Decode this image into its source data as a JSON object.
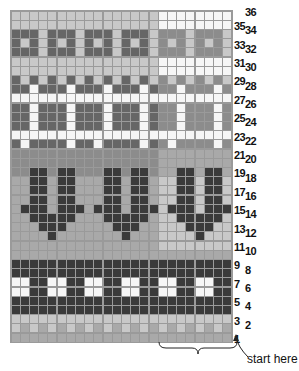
{
  "colors": {
    "W": "#f6f6f6",
    "L": "#c8c8c8",
    "M": "#a9a9a9",
    "G": "#8c8c8c",
    "D": "#666666",
    "K": "#3a3a3a"
  },
  "repeat_note": "8-stitch repeat highlighted in the right-hand columns",
  "columns": 24,
  "repeat_width": 8,
  "rows": [
    {
      "n": 36,
      "pattern": "LLLLLLLL",
      "right": "WWWWWWWW"
    },
    {
      "n": 35,
      "pattern": "LLLLLLLL",
      "right": "WWWWWWWW"
    },
    {
      "n": 34,
      "pattern": "DDDLDDDL",
      "right": "GGGLGGGL"
    },
    {
      "n": 33,
      "pattern": "DLDLDLDL",
      "right": "GLGLGLGL"
    },
    {
      "n": 32,
      "pattern": "DDDLDDDL",
      "right": "GGGLGGGL"
    },
    {
      "n": 31,
      "pattern": "LLLLLLLL",
      "right": "WWWWWWWW"
    },
    {
      "n": 30,
      "pattern": "LLLLLLLL",
      "right": "WWWWWWWW"
    },
    {
      "n": 29,
      "pattern": "DLDLDLDL",
      "right": "GLGLGLGL"
    },
    {
      "n": 28,
      "pattern": "DDWDDDWD",
      "right": "GGWGGGWG"
    },
    {
      "n": 27,
      "pattern": "WWWWWWWW",
      "right": "WWWWWWWW"
    },
    {
      "n": 26,
      "pattern": "DDWDDDWD",
      "right": "GGWGGGWG"
    },
    {
      "n": 25,
      "pattern": "DDWDDDWD",
      "right": "GGWGGGWG"
    },
    {
      "n": 24,
      "pattern": "DDWDDDWD",
      "right": "GGWGGGWG"
    },
    {
      "n": 23,
      "pattern": "WWWWWWWW",
      "right": "WWWWWWWW"
    },
    {
      "n": 22,
      "pattern": "DWDDDDWD",
      "right": "GWGGGGWG"
    },
    {
      "n": 21,
      "pattern": "GGGGGGGG",
      "right": "MMMMMMMM"
    },
    {
      "n": 20,
      "pattern": "GGGGGGGG",
      "right": "MMMMMMMM"
    },
    {
      "n": 19,
      "pattern": "GGKKGKKG",
      "right": "MMKKMKKM"
    },
    {
      "n": 18,
      "pattern": "MMKKMKKM",
      "right": "LLKKLKKL"
    },
    {
      "n": 17,
      "pattern": "MMKKMKKM",
      "right": "LLKKLKKL"
    },
    {
      "n": 16,
      "pattern": "MMKKMKKM",
      "right": "LLKKLKKL"
    },
    {
      "n": 15,
      "pattern": "MKKKMKKK",
      "right": "LKKKLKKK"
    },
    {
      "n": 14,
      "pattern": "MMKKKKKM",
      "right": "LLKKKKKL"
    },
    {
      "n": 13,
      "pattern": "MMMKKKMM",
      "right": "LLLKKKLL"
    },
    {
      "n": 12,
      "pattern": "MMMMKMMM",
      "right": "LLLLKLLL"
    },
    {
      "n": 11,
      "pattern": "MMMMMMMM",
      "right": "LLLLLLLL"
    },
    {
      "n": 10,
      "pattern": "MMMMMMMM",
      "right": "MMMMMMMM"
    },
    {
      "n": 9,
      "pattern": "KKKKKKKK",
      "right": "KKKKKKKK"
    },
    {
      "n": 8,
      "pattern": "KKKKKKKK",
      "right": "KKKKKKKK"
    },
    {
      "n": 7,
      "pattern": "WWKKWWKK",
      "right": "WWKKWWKK"
    },
    {
      "n": 6,
      "pattern": "WWKKWWKK",
      "right": "WWKKWWKK"
    },
    {
      "n": 5,
      "pattern": "KKKKKKKK",
      "right": "KKKKKKKK"
    },
    {
      "n": 4,
      "pattern": "KKKKKKKK",
      "right": "KKKKKKKK"
    },
    {
      "n": 3,
      "pattern": "LLLLLLLL",
      "right": "LLLLLLLL"
    },
    {
      "n": 2,
      "pattern": "LMLMLMLM",
      "right": "LMLMLMLM"
    },
    {
      "n": 1,
      "pattern": "MMMMMMMM",
      "right": "MMMMMMMM"
    }
  ],
  "start_label": "start here"
}
